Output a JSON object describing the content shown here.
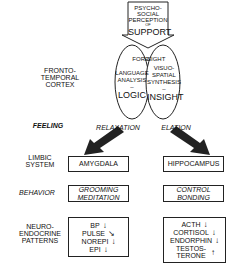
{
  "top_input": {
    "lines": [
      "PSYCHO-",
      "SOCIAL",
      "PERCEPTION",
      "OF",
      "SUPPORT"
    ]
  },
  "cortex": {
    "label_lines": [
      "FRONTO-",
      "TEMPORAL",
      "CORTEX"
    ],
    "left_hemisphere": {
      "header": "FORE",
      "function_lines": [
        "LANGUAGE",
        "ANALYSIS"
      ],
      "mode": "LOGIC"
    },
    "right_hemisphere": {
      "header": "SIGHT",
      "function_lines": [
        "VISUO-",
        "SPATIAL",
        "SYNTHESIS"
      ],
      "mode": "INSIGHT"
    }
  },
  "feeling": {
    "label": "FEELING",
    "left": "RELAXATION",
    "right": "ELATION"
  },
  "limbic": {
    "label_lines": [
      "LIMBIC",
      "SYSTEM"
    ],
    "left": "AMYGDALA",
    "right": "HIPPOCAMPUS"
  },
  "behavior": {
    "label": "BEHAVIOR",
    "left_lines": [
      "GROOMING",
      "MEDITATION"
    ],
    "right_lines": [
      "CONTROL",
      "BONDING"
    ]
  },
  "neuroendocrine": {
    "label_lines": [
      "NEURO-",
      "ENDOCRINE",
      "PATTERNS"
    ],
    "left": [
      {
        "name": "BP",
        "trend": "↓"
      },
      {
        "name": "PULSE",
        "trend": "↘"
      },
      {
        "name": "NOREPI",
        "trend": "↓"
      },
      {
        "name": "EPI",
        "trend": "↓"
      }
    ],
    "right": [
      {
        "name": "ACTH",
        "trend": "↓"
      },
      {
        "name": "CORTISOL",
        "trend": "↓"
      },
      {
        "name": "ENDORPHIN",
        "trend": "↓"
      },
      {
        "name": "TESTOS-TERONE",
        "trend": "↑"
      }
    ]
  }
}
